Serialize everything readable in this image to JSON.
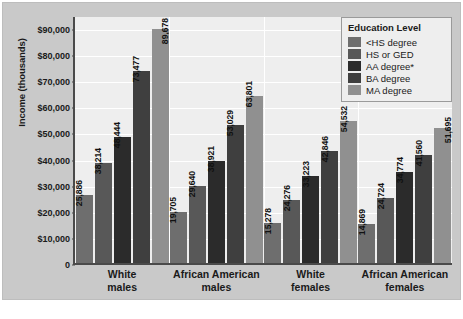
{
  "chart_data": {
    "type": "bar",
    "title": "",
    "xlabel": "",
    "ylabel": "Income (thousands)",
    "ylim": [
      0,
      95000
    ],
    "grid": true,
    "legend_position": "top-right",
    "legend_title": "Education Level",
    "categories": [
      "White males",
      "African American males",
      "White females",
      "African American females"
    ],
    "category_lines": [
      [
        "White",
        "males"
      ],
      [
        "African American",
        "males"
      ],
      [
        "White",
        "females"
      ],
      [
        "African American",
        "females"
      ]
    ],
    "y_ticks": [
      {
        "value": 0,
        "label": "0"
      },
      {
        "value": 10000,
        "label": "$10,000"
      },
      {
        "value": 20000,
        "label": "$20,000"
      },
      {
        "value": 30000,
        "label": "$30,000"
      },
      {
        "value": 40000,
        "label": "$40,000"
      },
      {
        "value": 50000,
        "label": "$50,000"
      },
      {
        "value": 60000,
        "label": "$60,000"
      },
      {
        "value": 70000,
        "label": "$70,000"
      },
      {
        "value": 80000,
        "label": "$80,000"
      },
      {
        "value": 90000,
        "label": "$90,000"
      }
    ],
    "series": [
      {
        "name": "<HS degree",
        "color": "#6e6e6e",
        "values": [
          25886,
          19705,
          15278,
          14869
        ],
        "labels": [
          "25,886",
          "19,705",
          "15,278",
          "14,869"
        ]
      },
      {
        "name": "HS or GED",
        "color": "#585858",
        "values": [
          38214,
          29640,
          24276,
          24724
        ],
        "labels": [
          "38,214",
          "29,640",
          "24,276",
          "24,724"
        ]
      },
      {
        "name": "AA degree*",
        "color": "#2b2b2b",
        "values": [
          48444,
          38921,
          33223,
          34774
        ],
        "labels": [
          "48,444",
          "38,921",
          "33,223",
          "34,774"
        ]
      },
      {
        "name": "BA degree",
        "color": "#3f3f3f",
        "values": [
          73477,
          53029,
          42846,
          41560
        ],
        "labels": [
          "73,477",
          "53,029",
          "42,846",
          "41,560"
        ]
      },
      {
        "name": "MA degree",
        "color": "#909090",
        "values": [
          89678,
          63801,
          54532,
          51695
        ],
        "labels": [
          "89,678",
          "63,801",
          "54,532",
          "51,695"
        ]
      }
    ],
    "value_label_inside": [
      [
        false,
        false,
        false,
        false,
        true
      ],
      [
        false,
        false,
        false,
        false,
        false
      ],
      [
        false,
        false,
        false,
        false,
        false
      ],
      [
        false,
        false,
        false,
        false,
        true
      ]
    ],
    "footnote": "",
    "colors": {
      "panel_background": "#c9c9c9",
      "plot_background": "#eeeeee",
      "axis": "#4a4a4a",
      "gridline": "#ffffff",
      "text": "#1a1a1a"
    }
  }
}
